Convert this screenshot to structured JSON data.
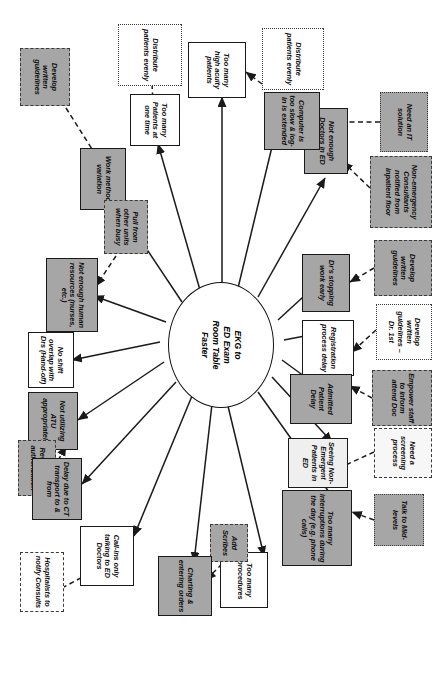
{
  "diagram": {
    "type": "spider-cause-effect-diagram",
    "orientation": "rotated-90-clockwise",
    "hub": {
      "label": "EKG to\nED Exam\nRoom Table\nFaster"
    },
    "legend_fills": {
      "cause_gray": "#a6a6a6",
      "cause_white": "#ffffff",
      "cause_light": "#efefef",
      "solution_dashed": "#a6a6a6"
    },
    "nodes": [
      {
        "id": "n1",
        "label": "Need an IT solution"
      },
      {
        "id": "n2",
        "label": "Non-emergency Consultants notified from inpatient floor"
      },
      {
        "id": "n3",
        "label": "Develop written guidelines"
      },
      {
        "id": "n4",
        "label": "Develop written guidelines – Dr. 1st"
      },
      {
        "id": "n5",
        "label": "Empower staff to inform attend Doc"
      },
      {
        "id": "n6",
        "label": "Need a screening process"
      },
      {
        "id": "n7",
        "label": "Talk to Mid-levels"
      },
      {
        "id": "n8",
        "label": "Not enough Doctors in ED"
      },
      {
        "id": "n9",
        "label": "Dr's stopping work early"
      },
      {
        "id": "n10",
        "label": "Registration process delay"
      },
      {
        "id": "n11",
        "label": "Admitted Patient Delay"
      },
      {
        "id": "n12",
        "label": "Seeing Non-Emergent Patients in ED"
      },
      {
        "id": "n13",
        "label": "Too many interruptions during the day (e.g. phone calls)"
      },
      {
        "id": "n14",
        "label": "Distribute patients evenly"
      },
      {
        "id": "n15",
        "label": "Computer is too slow & log-in is extended"
      },
      {
        "id": "n16",
        "label": "Too many high acuity patients"
      },
      {
        "id": "n17",
        "label": "Too many procedures"
      },
      {
        "id": "n18",
        "label": "Add Scribes"
      },
      {
        "id": "n19",
        "label": "Charting & entering orders"
      },
      {
        "id": "n20",
        "label": "Distribute patients evenly"
      },
      {
        "id": "n21",
        "label": "Too many Patients at one time"
      },
      {
        "id": "n22",
        "label": "Work method variation"
      },
      {
        "id": "n23",
        "label": "Develop written guidelines"
      },
      {
        "id": "n24",
        "label": "Pull from other units when busy"
      },
      {
        "id": "n25",
        "label": "Not enough human resources (nurses, etc.)"
      },
      {
        "id": "n26",
        "label": "Call-ins only talking to ED Doctors"
      },
      {
        "id": "n27",
        "label": "No shift overlap with Drs (Hand-off)"
      },
      {
        "id": "n28",
        "label": "Not utilizing ATU appropriately"
      },
      {
        "id": "n29",
        "label": "Review ATU authorization"
      },
      {
        "id": "n30",
        "label": "Delay due to CT transport to & from"
      },
      {
        "id": "n31",
        "label": "Hospitalists to notify Consults"
      }
    ]
  }
}
